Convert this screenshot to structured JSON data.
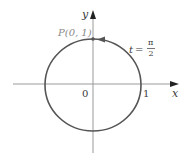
{
  "diagram": {
    "axes": {
      "x_label": "x",
      "y_label": "y",
      "origin_label": "0",
      "x_tick_label": "1"
    },
    "point": {
      "label": "P(0, 1)",
      "x": 0,
      "y": 1
    },
    "parameter": {
      "variable": "t",
      "equals": "=",
      "numerator": "π",
      "denominator": "2"
    },
    "colors": {
      "circle": "#555555",
      "axes": "#9a9a9a",
      "label": "#3a3a3a",
      "point_label": "#8a8a8a"
    }
  }
}
